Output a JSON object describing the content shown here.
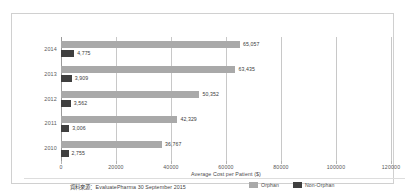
{
  "chart_data": {
    "type": "bar",
    "orientation": "horizontal",
    "title": "",
    "xlabel": "Average Cost per Patient ($)",
    "ylabel": "",
    "categories": [
      "2014",
      "2013",
      "2012",
      "2011",
      "2010"
    ],
    "xlim": [
      0,
      120000
    ],
    "xticks": [
      0,
      20000,
      40000,
      60000,
      80000,
      100000,
      120000
    ],
    "xtick_labels": [
      "0",
      "20000",
      "40000",
      "60000",
      "80000",
      "100000",
      "120000"
    ],
    "grid": true,
    "legend_position": "bottom-right",
    "series": [
      {
        "name": "Orphan",
        "color": "#a9a9a9",
        "values": [
          65057,
          63435,
          50352,
          42329,
          36767
        ],
        "data_labels": [
          "65,057",
          "63,435",
          "50,352",
          "42,329",
          "36,767"
        ]
      },
      {
        "name": "Non-Orphan",
        "color": "#3f3f3f",
        "values": [
          4775,
          3909,
          3562,
          3006,
          2755
        ],
        "data_labels": [
          "4,775",
          "3,909",
          "3,562",
          "3,006",
          "2,755"
        ]
      }
    ],
    "source_note": "資料來源：EvaluatePharma 30 September 2015"
  },
  "legend": {
    "items": [
      {
        "label": "Orphan",
        "color": "#a9a9a9"
      },
      {
        "label": "Non-Orphan",
        "color": "#3f3f3f"
      }
    ]
  },
  "footer": {
    "source": "資料來源：EvaluatePharma 30 September 2015"
  }
}
